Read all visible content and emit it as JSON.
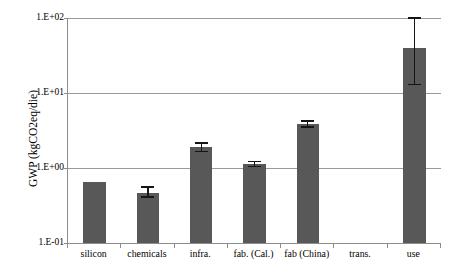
{
  "chart_data": {
    "type": "bar",
    "title": "",
    "xlabel": "",
    "ylabel": "GWP (kgCO2eq/die)",
    "ylabel_parts": {
      "prefix": "GWP (kgCO",
      "subscript": "2",
      "suffix": "eq/die)"
    },
    "yscale": "log",
    "ylim": [
      0.1,
      100
    ],
    "grid": true,
    "legend": "none",
    "y_tick_labels": [
      "1.E+02",
      "1.E+01",
      "1.E+00",
      "1.E-01"
    ],
    "y_tick_values": [
      100,
      10,
      1,
      0.1
    ],
    "categories": [
      "silicon",
      "chemicals",
      "infra.",
      "fab. (Cal.)",
      "fab (China)",
      "trans.",
      "use"
    ],
    "values": [
      0.65,
      0.47,
      1.9,
      1.14,
      3.9,
      0.0,
      40
    ],
    "error_low": [
      null,
      0.41,
      1.65,
      1.05,
      3.55,
      null,
      13
    ],
    "error_high": [
      null,
      0.56,
      2.15,
      1.22,
      4.25,
      null,
      100
    ],
    "series": [
      {
        "name": "GWP",
        "values": [
          0.65,
          0.47,
          1.9,
          1.14,
          3.9,
          0.0,
          40
        ]
      }
    ],
    "annotations": [],
    "colors": {
      "bar_fill": "#585858",
      "error_bar": "#151515",
      "gridline": "#9a9a9a",
      "axis": "#8c8c8c",
      "text": "#000000",
      "background": "#ffffff"
    }
  }
}
